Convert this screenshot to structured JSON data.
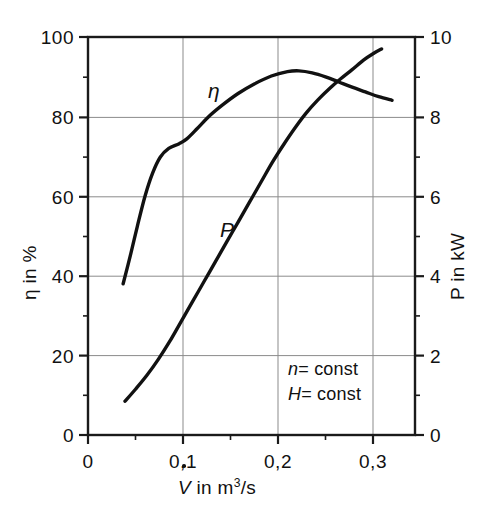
{
  "chart_data": {
    "type": "line",
    "title": "",
    "xlabel": "V̇ in m³/s",
    "ylabel": "η in %",
    "ylabel_right": "P in kW",
    "xlim": [
      0,
      0.3442
    ],
    "ylim": [
      0,
      100
    ],
    "ylim_right": [
      0,
      10
    ],
    "grid": true,
    "legend_position": "inline-curve-labels",
    "x_ticks": [
      0,
      0.1,
      0.2,
      0.3
    ],
    "x_tick_labels": [
      "0",
      "0,1",
      "0,2",
      "0,3"
    ],
    "x_minor_ticks": [
      0.05,
      0.15,
      0.25
    ],
    "y_ticks": [
      0,
      20,
      40,
      60,
      80,
      100
    ],
    "y_tick_labels": [
      "0",
      "20",
      "40",
      "60",
      "80",
      "100"
    ],
    "y_minor_ticks": [
      10,
      30,
      50,
      70,
      90
    ],
    "y_ticks_right": [
      0,
      2,
      4,
      6,
      8,
      10
    ],
    "y_tick_labels_right": [
      "0",
      "2",
      "4",
      "6",
      "8",
      "10"
    ],
    "y_minor_ticks_right": [
      1,
      3,
      5,
      7,
      9
    ],
    "gridlines_x": [
      0.1,
      0.2,
      0.3
    ],
    "gridlines_y": [
      20,
      40,
      60,
      80
    ],
    "annotations": [
      "n = const",
      "H = const"
    ],
    "series": [
      {
        "name": "η",
        "label": "η",
        "axis": "left",
        "units": "%",
        "color": "#111111",
        "points": [
          [
            0.037,
            38.0
          ],
          [
            0.045,
            45.5
          ],
          [
            0.052,
            52.5
          ],
          [
            0.06,
            60.0
          ],
          [
            0.068,
            65.8
          ],
          [
            0.076,
            69.8
          ],
          [
            0.085,
            72.0
          ],
          [
            0.096,
            73.2
          ],
          [
            0.104,
            74.4
          ],
          [
            0.115,
            77.0
          ],
          [
            0.128,
            80.2
          ],
          [
            0.142,
            83.0
          ],
          [
            0.158,
            85.8
          ],
          [
            0.175,
            88.2
          ],
          [
            0.193,
            90.2
          ],
          [
            0.21,
            91.3
          ],
          [
            0.222,
            91.5
          ],
          [
            0.236,
            91.0
          ],
          [
            0.25,
            90.0
          ],
          [
            0.264,
            88.7
          ],
          [
            0.278,
            87.4
          ],
          [
            0.292,
            86.2
          ],
          [
            0.306,
            85.0
          ],
          [
            0.32,
            84.1
          ]
        ]
      },
      {
        "name": "P",
        "label": "P",
        "axis": "right",
        "units": "kW",
        "color": "#111111",
        "points": [
          [
            0.039,
            0.85
          ],
          [
            0.05,
            1.15
          ],
          [
            0.062,
            1.5
          ],
          [
            0.074,
            1.9
          ],
          [
            0.086,
            2.35
          ],
          [
            0.098,
            2.85
          ],
          [
            0.11,
            3.35
          ],
          [
            0.122,
            3.85
          ],
          [
            0.134,
            4.35
          ],
          [
            0.146,
            4.85
          ],
          [
            0.158,
            5.35
          ],
          [
            0.17,
            5.85
          ],
          [
            0.182,
            6.35
          ],
          [
            0.194,
            6.85
          ],
          [
            0.206,
            7.3
          ],
          [
            0.218,
            7.72
          ],
          [
            0.23,
            8.1
          ],
          [
            0.242,
            8.42
          ],
          [
            0.254,
            8.7
          ],
          [
            0.266,
            8.95
          ],
          [
            0.278,
            9.18
          ],
          [
            0.29,
            9.42
          ],
          [
            0.3,
            9.58
          ],
          [
            0.309,
            9.7
          ]
        ]
      }
    ]
  },
  "axes": {
    "left_title": "η in %",
    "right_title": "P in kW",
    "bottom_title_symbol": "V",
    "bottom_title_rest": " in m",
    "bottom_title_exp": "3",
    "bottom_title_tail": "/s"
  },
  "labels": {
    "x_0": "0",
    "x_01": "0,1",
    "x_02": "0,2",
    "x_03": "0,3",
    "y_0": "0",
    "y_20": "20",
    "y_40": "40",
    "y_60": "60",
    "y_80": "80",
    "y_100": "100",
    "yr_0": "0",
    "yr_2": "2",
    "yr_4": "4",
    "yr_6": "6",
    "yr_8": "8",
    "yr_10": "10"
  },
  "curve_labels": {
    "eta": "η",
    "power": "P"
  },
  "annotations": {
    "n_symbol": "n",
    "n_value": "= const",
    "h_symbol": "H",
    "h_value": "= const"
  },
  "style": {
    "curve_color": "#111111",
    "grid_color": "#8b8b8b",
    "frame_color": "#1a1a1a",
    "background": "#ffffff"
  }
}
